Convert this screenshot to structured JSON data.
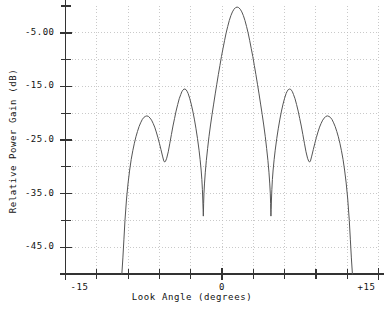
{
  "chart_data": {
    "type": "line",
    "title": "",
    "xlabel": "Look Angle (degrees)",
    "ylabel": "Relative Power Gain (dB)",
    "xlim": [
      -15,
      15
    ],
    "ylim": [
      -50,
      0
    ],
    "grid": true,
    "legend": null,
    "x_tick_labels": [
      "-15",
      "0",
      "+15"
    ],
    "x_tick_values": [
      -15,
      0,
      15
    ],
    "x_minor_tick_values": [
      -12,
      -9,
      -6,
      -3,
      3,
      6,
      9,
      12
    ],
    "y_tick_labels": [
      "-5.00",
      "-15.0",
      "-25.0",
      "-35.0",
      "-45.0"
    ],
    "y_tick_values": [
      -5,
      -15,
      -25,
      -35,
      -45
    ],
    "y_minor_tick_values": [
      -10,
      -20,
      -30,
      -40,
      -50
    ],
    "series": [
      {
        "name": "Relative Power Gain",
        "points": [
          [
            -9.6,
            -50.0
          ],
          [
            -9.5,
            -47.0
          ],
          [
            -9.4,
            -43.5
          ],
          [
            -9.3,
            -40.0
          ],
          [
            -9.15,
            -36.0
          ],
          [
            -9.0,
            -33.0
          ],
          [
            -8.85,
            -30.6
          ],
          [
            -8.7,
            -28.6
          ],
          [
            -8.55,
            -27.0
          ],
          [
            -8.4,
            -25.6
          ],
          [
            -8.25,
            -24.4
          ],
          [
            -8.1,
            -23.4
          ],
          [
            -7.95,
            -22.5
          ],
          [
            -7.8,
            -21.8
          ],
          [
            -7.65,
            -21.2
          ],
          [
            -7.5,
            -20.8
          ],
          [
            -7.35,
            -20.6
          ],
          [
            -7.2,
            -20.5
          ],
          [
            -7.05,
            -20.6
          ],
          [
            -6.9,
            -20.9
          ],
          [
            -6.75,
            -21.3
          ],
          [
            -6.6,
            -21.9
          ],
          [
            -6.45,
            -22.6
          ],
          [
            -6.3,
            -23.5
          ],
          [
            -6.15,
            -24.5
          ],
          [
            -6.0,
            -25.6
          ],
          [
            -5.85,
            -26.8
          ],
          [
            -5.7,
            -28.0
          ],
          [
            -5.58,
            -28.9
          ],
          [
            -5.5,
            -29.1
          ],
          [
            -5.42,
            -29.0
          ],
          [
            -5.3,
            -28.4
          ],
          [
            -5.15,
            -27.2
          ],
          [
            -5.0,
            -25.6
          ],
          [
            -4.85,
            -24.0
          ],
          [
            -4.7,
            -22.4
          ],
          [
            -4.55,
            -21.0
          ],
          [
            -4.4,
            -19.6
          ],
          [
            -4.25,
            -18.4
          ],
          [
            -4.1,
            -17.3
          ],
          [
            -3.95,
            -16.5
          ],
          [
            -3.85,
            -16.0
          ],
          [
            -3.75,
            -15.7
          ],
          [
            -3.65,
            -15.5
          ],
          [
            -3.55,
            -15.5
          ],
          [
            -3.45,
            -15.6
          ],
          [
            -3.35,
            -15.9
          ],
          [
            -3.25,
            -16.3
          ],
          [
            -3.1,
            -17.2
          ],
          [
            -2.95,
            -18.3
          ],
          [
            -2.8,
            -19.6
          ],
          [
            -2.65,
            -21.1
          ],
          [
            -2.5,
            -22.8
          ],
          [
            -2.35,
            -24.7
          ],
          [
            -2.2,
            -26.9
          ],
          [
            -2.1,
            -28.6
          ],
          [
            -2.0,
            -30.6
          ],
          [
            -1.93,
            -32.4
          ],
          [
            -1.88,
            -34.2
          ],
          [
            -1.84,
            -36.2
          ],
          [
            -1.81,
            -38.0
          ],
          [
            -1.79,
            -39.2
          ],
          [
            -1.78,
            -38.6
          ],
          [
            -1.76,
            -36.8
          ],
          [
            -1.73,
            -35.0
          ],
          [
            -1.68,
            -33.2
          ],
          [
            -1.6,
            -31.0
          ],
          [
            -1.5,
            -28.8
          ],
          [
            -1.38,
            -26.6
          ],
          [
            -1.25,
            -24.4
          ],
          [
            -1.1,
            -22.2
          ],
          [
            -0.95,
            -20.2
          ],
          [
            -0.8,
            -18.3
          ],
          [
            -0.65,
            -16.4
          ],
          [
            -0.5,
            -14.6
          ],
          [
            -0.35,
            -12.8
          ],
          [
            -0.2,
            -11.1
          ],
          [
            -0.05,
            -9.4
          ],
          [
            0.1,
            -7.9
          ],
          [
            0.25,
            -6.4
          ],
          [
            0.4,
            -5.0
          ],
          [
            0.55,
            -3.8
          ],
          [
            0.7,
            -2.7
          ],
          [
            0.85,
            -1.8
          ],
          [
            1.0,
            -1.1
          ],
          [
            1.15,
            -0.6
          ],
          [
            1.3,
            -0.3
          ],
          [
            1.45,
            -0.2
          ],
          [
            1.6,
            -0.3
          ],
          [
            1.75,
            -0.6
          ],
          [
            1.9,
            -1.1
          ],
          [
            2.05,
            -1.8
          ],
          [
            2.2,
            -2.7
          ],
          [
            2.35,
            -3.8
          ],
          [
            2.5,
            -5.0
          ],
          [
            2.65,
            -6.4
          ],
          [
            2.8,
            -7.9
          ],
          [
            2.95,
            -9.4
          ],
          [
            3.1,
            -11.1
          ],
          [
            3.25,
            -12.8
          ],
          [
            3.4,
            -14.6
          ],
          [
            3.55,
            -16.4
          ],
          [
            3.7,
            -18.3
          ],
          [
            3.85,
            -20.2
          ],
          [
            4.0,
            -22.2
          ],
          [
            4.15,
            -24.4
          ],
          [
            4.28,
            -26.6
          ],
          [
            4.4,
            -28.8
          ],
          [
            4.5,
            -31.0
          ],
          [
            4.58,
            -33.2
          ],
          [
            4.63,
            -35.0
          ],
          [
            4.66,
            -36.8
          ],
          [
            4.68,
            -38.6
          ],
          [
            4.69,
            -39.2
          ],
          [
            4.71,
            -38.0
          ],
          [
            4.74,
            -36.2
          ],
          [
            4.78,
            -34.2
          ],
          [
            4.83,
            -32.4
          ],
          [
            4.9,
            -30.6
          ],
          [
            5.0,
            -28.6
          ],
          [
            5.1,
            -26.9
          ],
          [
            5.25,
            -24.7
          ],
          [
            5.4,
            -22.8
          ],
          [
            5.55,
            -21.1
          ],
          [
            5.7,
            -19.6
          ],
          [
            5.85,
            -18.3
          ],
          [
            6.0,
            -17.2
          ],
          [
            6.15,
            -16.3
          ],
          [
            6.25,
            -15.9
          ],
          [
            6.35,
            -15.6
          ],
          [
            6.45,
            -15.5
          ],
          [
            6.55,
            -15.5
          ],
          [
            6.65,
            -15.7
          ],
          [
            6.75,
            -16.0
          ],
          [
            6.85,
            -16.5
          ],
          [
            7.0,
            -17.3
          ],
          [
            7.15,
            -18.4
          ],
          [
            7.3,
            -19.6
          ],
          [
            7.45,
            -21.0
          ],
          [
            7.6,
            -22.4
          ],
          [
            7.75,
            -24.0
          ],
          [
            7.9,
            -25.6
          ],
          [
            8.05,
            -27.2
          ],
          [
            8.2,
            -28.4
          ],
          [
            8.32,
            -29.0
          ],
          [
            8.4,
            -29.1
          ],
          [
            8.48,
            -28.9
          ],
          [
            8.6,
            -28.0
          ],
          [
            8.75,
            -26.8
          ],
          [
            8.9,
            -25.6
          ],
          [
            9.05,
            -24.5
          ],
          [
            9.2,
            -23.5
          ],
          [
            9.35,
            -22.6
          ],
          [
            9.5,
            -21.9
          ],
          [
            9.65,
            -21.3
          ],
          [
            9.8,
            -20.9
          ],
          [
            9.95,
            -20.6
          ],
          [
            10.1,
            -20.5
          ],
          [
            10.25,
            -20.6
          ],
          [
            10.4,
            -20.8
          ],
          [
            10.55,
            -21.2
          ],
          [
            10.7,
            -21.8
          ],
          [
            10.85,
            -22.5
          ],
          [
            11.0,
            -23.4
          ],
          [
            11.15,
            -24.4
          ],
          [
            11.3,
            -25.6
          ],
          [
            11.45,
            -27.0
          ],
          [
            11.6,
            -28.6
          ],
          [
            11.75,
            -30.6
          ],
          [
            11.9,
            -33.0
          ],
          [
            12.05,
            -36.0
          ],
          [
            12.2,
            -40.0
          ],
          [
            12.3,
            -43.5
          ],
          [
            12.4,
            -47.0
          ],
          [
            12.5,
            -50.0
          ]
        ]
      }
    ],
    "annotations": {
      "main_lobe_peak_db": -0.2,
      "main_lobe_peak_deg": 1.45,
      "inner_sidelobe_peak_db": -15.5,
      "outer_sidelobe_peak_db": -20.5,
      "deep_null_db": -39.2,
      "shallow_null_db": -29.1
    }
  },
  "style": {
    "line_color": "#555555",
    "axis_color": "#333333",
    "grid_color": "#bbbbbb",
    "background": "#ffffff"
  }
}
